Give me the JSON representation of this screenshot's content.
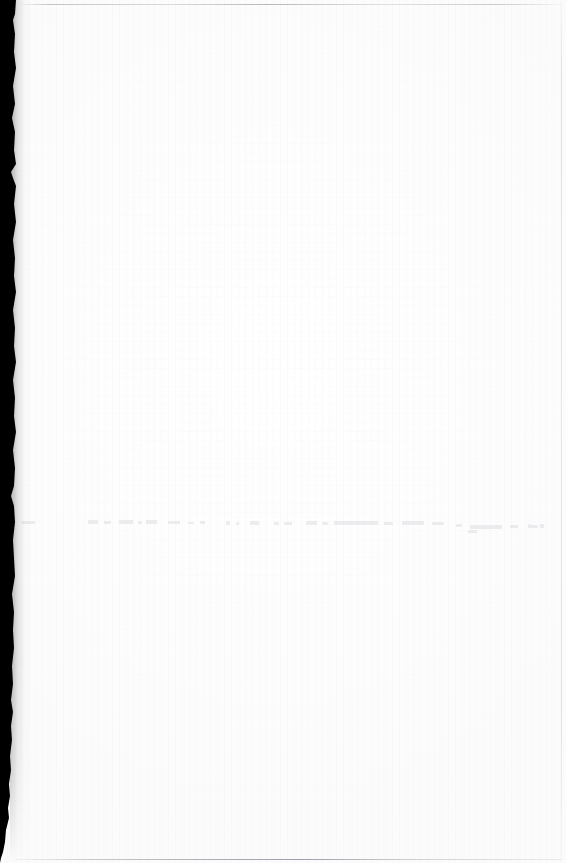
{
  "document": {
    "kind": "scanned-page",
    "page_state": "blank",
    "visible_text": "",
    "readable_content_present": false,
    "note_on_content": "No legible printed or handwritten text is present on this scanned sheet."
  },
  "canvas": {
    "width_px": 566,
    "height_px": 863,
    "paper_color": "#fdfdfe",
    "background_color": "#ffffff"
  },
  "artifacts": {
    "gutter": {
      "name": "scanner-gutter-shadow",
      "edge": "left",
      "color": "#000000",
      "width_top_px": 16,
      "width_bottom_px": 1,
      "starts_y_px": 0,
      "ends_y_px": 863,
      "description": "Solid black binding-gutter band with a ragged right boundary that tapers toward the bottom."
    },
    "edge_lines": [
      {
        "name": "top-scan-edge-line",
        "orientation": "horizontal",
        "position_y_px": 4,
        "color": "#9696a0",
        "opacity": 0.55
      },
      {
        "name": "bottom-scan-edge-line",
        "orientation": "horizontal",
        "position_y_px": 859,
        "color": "#82828e",
        "opacity": 0.66
      },
      {
        "name": "right-scan-edge-line",
        "orientation": "vertical",
        "position_x_px": 561,
        "color": "#b4b4bc",
        "opacity": 0.34
      }
    ],
    "show_through": {
      "name": "reverse-side-bleed-text",
      "row_top_px": 512,
      "row_height_px": 22,
      "color": "#d6d6dc",
      "opacity": 0.42,
      "legible": false,
      "description": "A single faint horizontal row of illegible ghost marks bleeding through from the reverse side of the sheet."
    }
  },
  "ghost_marks": [
    {
      "x": 0,
      "y": 9,
      "w": 13,
      "h": 3
    },
    {
      "x": 66,
      "y": 8,
      "w": 10,
      "h": 4
    },
    {
      "x": 82,
      "y": 9,
      "w": 7,
      "h": 3
    },
    {
      "x": 97,
      "y": 8,
      "w": 14,
      "h": 4
    },
    {
      "x": 116,
      "y": 9,
      "w": 4,
      "h": 3
    },
    {
      "x": 124,
      "y": 8,
      "w": 11,
      "h": 4
    },
    {
      "x": 146,
      "y": 9,
      "w": 12,
      "h": 3
    },
    {
      "x": 166,
      "y": 10,
      "w": 6,
      "h": 2
    },
    {
      "x": 178,
      "y": 9,
      "w": 5,
      "h": 3
    },
    {
      "x": 204,
      "y": 9,
      "w": 4,
      "h": 4
    },
    {
      "x": 214,
      "y": 10,
      "w": 3,
      "h": 3
    },
    {
      "x": 228,
      "y": 9,
      "w": 9,
      "h": 4
    },
    {
      "x": 252,
      "y": 10,
      "w": 5,
      "h": 3
    },
    {
      "x": 262,
      "y": 10,
      "w": 8,
      "h": 3
    },
    {
      "x": 284,
      "y": 9,
      "w": 11,
      "h": 4
    },
    {
      "x": 300,
      "y": 10,
      "w": 6,
      "h": 3
    },
    {
      "x": 312,
      "y": 9,
      "w": 44,
      "h": 4
    },
    {
      "x": 362,
      "y": 10,
      "w": 9,
      "h": 3
    },
    {
      "x": 380,
      "y": 9,
      "w": 22,
      "h": 4
    },
    {
      "x": 410,
      "y": 10,
      "w": 12,
      "h": 3
    },
    {
      "x": 434,
      "y": 12,
      "w": 6,
      "h": 3
    },
    {
      "x": 448,
      "y": 13,
      "w": 32,
      "h": 4
    },
    {
      "x": 488,
      "y": 13,
      "w": 8,
      "h": 3
    },
    {
      "x": 506,
      "y": 13,
      "w": 10,
      "h": 3
    },
    {
      "x": 518,
      "y": 12,
      "w": 4,
      "h": 4
    },
    {
      "x": 446,
      "y": 18,
      "w": 9,
      "h": 3
    },
    {
      "x": 506,
      "y": 12,
      "w": 3,
      "h": 3
    }
  ]
}
